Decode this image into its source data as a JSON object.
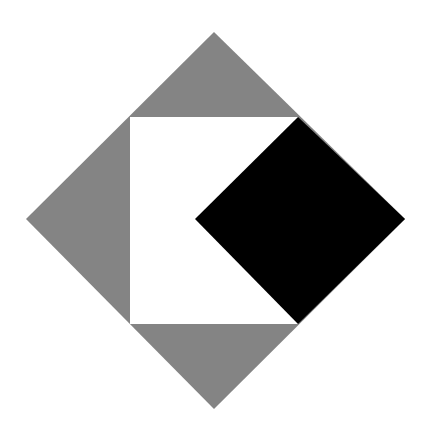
{
  "canvas": {
    "width": 428,
    "height": 439,
    "background": "#ffffff"
  },
  "colors": {
    "gray": "#848484",
    "white": "#ffffff",
    "black": "#000000"
  },
  "shapes": {
    "outer_diamond": {
      "description": "large gray diamond",
      "points": [
        [
          214,
          32
        ],
        [
          405,
          219
        ],
        [
          214,
          409
        ],
        [
          26,
          219
        ]
      ]
    },
    "inner_square": {
      "description": "white square inside diamond",
      "x": 130,
      "y": 117,
      "width": 168,
      "height": 207
    },
    "black_diamond": {
      "description": "black diamond on right side",
      "points": [
        [
          298,
          117
        ],
        [
          405,
          219
        ],
        [
          298,
          324
        ],
        [
          195,
          219
        ]
      ]
    }
  }
}
